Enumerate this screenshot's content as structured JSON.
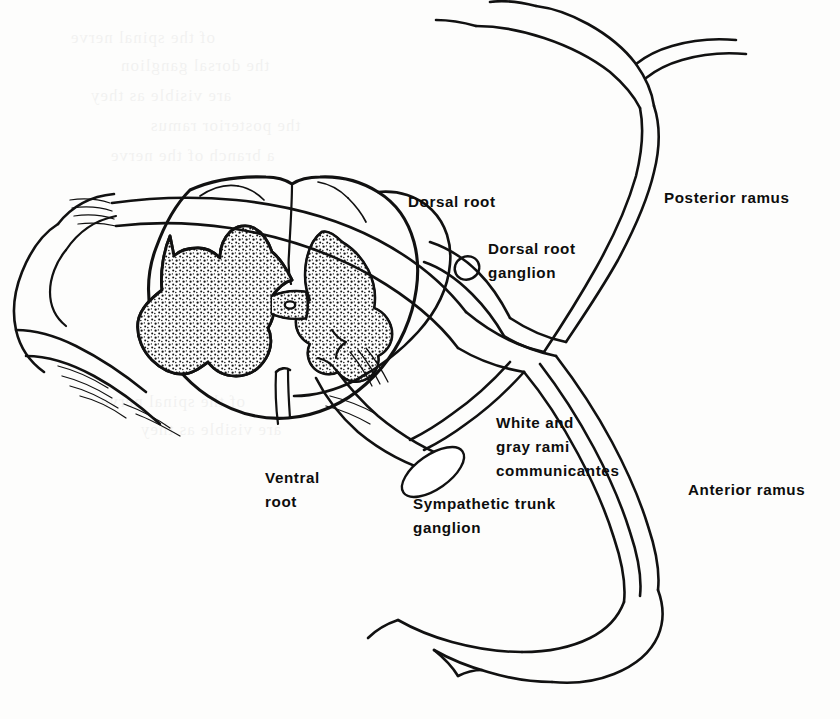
{
  "figure": {
    "kind": "anatomical-line-diagram",
    "style": "black ink line drawing on off-white book page",
    "background_color": "#fdfdfc",
    "ink_color": "#111111"
  },
  "labels": {
    "dorsal_root": "Dorsal root",
    "dorsal_root_ganglion_line1": "Dorsal root",
    "dorsal_root_ganglion_line2": "ganglion",
    "posterior_ramus": "Posterior ramus",
    "anterior_ramus": "Anterior ramus",
    "ventral_root_line1": "Ventral",
    "ventral_root_line2": "root",
    "rami_line1": "White and",
    "rami_line2": "gray rami",
    "rami_line3": "communicantes",
    "sympathetic_line1": "Sympathetic trunk",
    "sympathetic_line2": "ganglion"
  },
  "structures": [
    {
      "name": "spinal-cord-white-matter",
      "note": "oval cross-section with median fissures"
    },
    {
      "name": "gray-matter",
      "note": "stippled H / butterfly shape with central canal"
    },
    {
      "name": "central-canal",
      "note": "small opening at centre of gray commissure"
    },
    {
      "name": "dura-mater-sheath",
      "note": "outer sheath enveloping cord on left"
    },
    {
      "name": "dorsal-rootlets",
      "note": "fine filaments entering dorsolateral sulcus"
    },
    {
      "name": "ventral-rootlets",
      "note": "fine filaments leaving ventrolateral sulcus"
    },
    {
      "name": "dorsal-root-ganglion",
      "note": "small oval swelling on dorsal root"
    },
    {
      "name": "spinal-nerve-trunk",
      "note": "short trunk formed by union of roots"
    },
    {
      "name": "posterior-ramus",
      "note": "ascends and divides into medial and lateral branches"
    },
    {
      "name": "anterior-ramus",
      "note": "descends, larger, continues laterally"
    },
    {
      "name": "rami-communicantes",
      "note": "white and gray rami joining trunk to sympathetic ganglion"
    },
    {
      "name": "sympathetic-trunk-ganglion",
      "note": "elongated oval ganglion"
    }
  ],
  "ghost_text": [
    "of the spinal nerve",
    "the dorsal ganglion",
    "are visible as they",
    "the posterior ramus",
    "a branch of the nerve"
  ]
}
